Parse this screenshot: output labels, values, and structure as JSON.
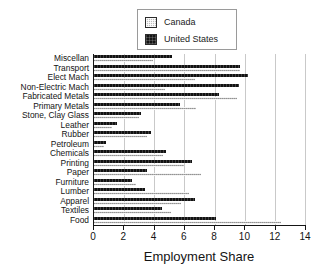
{
  "chart_data": {
    "type": "bar",
    "orientation": "horizontal",
    "title": "",
    "xlabel": "Employment Share",
    "ylabel": "",
    "xlim": [
      0,
      14
    ],
    "xticks": [
      0,
      2,
      4,
      6,
      8,
      10,
      12,
      14
    ],
    "grid": true,
    "grid_axis": "x",
    "legend_position": "top-center",
    "categories": [
      "Miscellan",
      "Transport",
      "Elect Mach",
      "Non-Electric Mach",
      "Fabricated Metals",
      "Primary Metals",
      "Stone, Clay Glass",
      "Leather",
      "Rubber",
      "Petroleum",
      "Chemicals",
      "Printing",
      "Paper",
      "Furniture",
      "Lumber",
      "Apparel",
      "Textiles",
      "Food"
    ],
    "series": [
      {
        "name": "United States",
        "color": "#121212",
        "values": [
          5.2,
          9.7,
          10.2,
          9.6,
          8.3,
          5.7,
          3.1,
          1.5,
          3.8,
          0.8,
          4.8,
          6.5,
          3.5,
          2.5,
          3.4,
          6.7,
          4.5,
          8.1
        ]
      },
      {
        "name": "Canada",
        "color": "#b4b4b4",
        "values": [
          3.9,
          9.7,
          6.7,
          4.7,
          9.5,
          6.8,
          3.0,
          1.2,
          3.5,
          0.65,
          4.6,
          6.0,
          7.1,
          2.8,
          6.3,
          5.8,
          5.1,
          12.4
        ]
      }
    ]
  },
  "legend": {
    "items": [
      {
        "label": "Canada",
        "swatch": "canada-swatch-icon"
      },
      {
        "label": "United States",
        "swatch": "united-states-swatch-icon"
      }
    ]
  },
  "axis": {
    "x_title": "Employment Share",
    "x_tick_labels": [
      "0",
      "2",
      "4",
      "6",
      "8",
      "10",
      "12",
      "14"
    ]
  }
}
